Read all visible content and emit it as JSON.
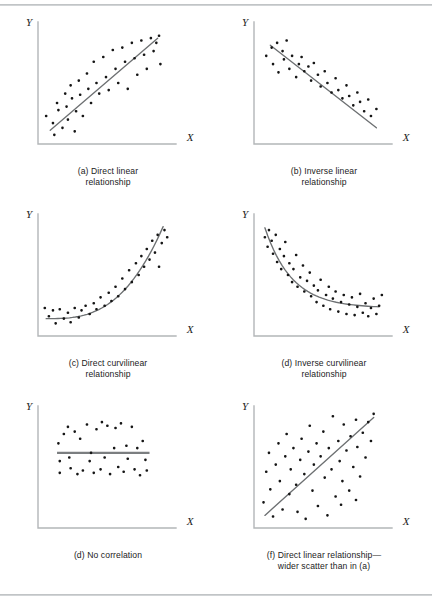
{
  "figure": {
    "background": "#ffffff",
    "rule_color": "#b9bcbe",
    "dot_color": "#151515",
    "axis_color": "#b3b6b8",
    "trend_color": "#6d7072",
    "axis_labels": {
      "x": "X",
      "y": "Y"
    }
  },
  "panels": [
    {
      "id": "a",
      "caption_line1": "(a) Direct linear",
      "caption_line2": "relationship"
    },
    {
      "id": "b",
      "caption_line1": "(b) Inverse linear",
      "caption_line2": "relationship"
    },
    {
      "id": "c",
      "caption_line1": "(c) Direct curvilinear",
      "caption_line2": "relationship"
    },
    {
      "id": "d",
      "caption_line1": "(d) Inverse curvilinear",
      "caption_line2": "relationship"
    },
    {
      "id": "e",
      "caption_line1": "(d) No correlation",
      "caption_line2": ""
    },
    {
      "id": "f",
      "caption_line1": "(f) Direct linear relationship—",
      "caption_line2": "wider scatter than in (a)"
    }
  ],
  "chart_data": [
    {
      "type": "scatter",
      "panel": "a",
      "title": "(a) Direct linear relationship",
      "xlabel": "X",
      "ylabel": "Y",
      "xlim": [
        0,
        100
      ],
      "ylim": [
        0,
        100
      ],
      "grid": false,
      "legend": "none",
      "trend": {
        "type": "line",
        "points": [
          [
            9,
            10
          ],
          [
            88,
            88
          ]
        ]
      },
      "points": [
        [
          6,
          22
        ],
        [
          11,
          16
        ],
        [
          12,
          6
        ],
        [
          14,
          33
        ],
        [
          15,
          27
        ],
        [
          18,
          12
        ],
        [
          20,
          41
        ],
        [
          21,
          30
        ],
        [
          22,
          19
        ],
        [
          24,
          48
        ],
        [
          25,
          37
        ],
        [
          27,
          9
        ],
        [
          28,
          26
        ],
        [
          30,
          52
        ],
        [
          31,
          40
        ],
        [
          33,
          22
        ],
        [
          36,
          58
        ],
        [
          37,
          45
        ],
        [
          39,
          33
        ],
        [
          41,
          68
        ],
        [
          43,
          50
        ],
        [
          45,
          41
        ],
        [
          48,
          72
        ],
        [
          50,
          55
        ],
        [
          52,
          44
        ],
        [
          55,
          78
        ],
        [
          57,
          62
        ],
        [
          59,
          50
        ],
        [
          62,
          80
        ],
        [
          64,
          68
        ],
        [
          66,
          45
        ],
        [
          69,
          84
        ],
        [
          71,
          71
        ],
        [
          73,
          57
        ],
        [
          76,
          86
        ],
        [
          78,
          74
        ],
        [
          80,
          62
        ],
        [
          83,
          88
        ],
        [
          85,
          77
        ],
        [
          87,
          84
        ],
        [
          89,
          90
        ],
        [
          90,
          66
        ]
      ]
    },
    {
      "type": "scatter",
      "panel": "b",
      "title": "(b) Inverse linear relationship",
      "xlabel": "X",
      "ylabel": "Y",
      "xlim": [
        0,
        100
      ],
      "ylim": [
        0,
        100
      ],
      "grid": false,
      "legend": "none",
      "trend": {
        "type": "line",
        "points": [
          [
            12,
            82
          ],
          [
            90,
            12
          ]
        ]
      },
      "points": [
        [
          9,
          73
        ],
        [
          13,
          80
        ],
        [
          14,
          66
        ],
        [
          17,
          84
        ],
        [
          18,
          59
        ],
        [
          21,
          77
        ],
        [
          22,
          70
        ],
        [
          24,
          86
        ],
        [
          26,
          62
        ],
        [
          28,
          73
        ],
        [
          31,
          55
        ],
        [
          33,
          66
        ],
        [
          35,
          72
        ],
        [
          37,
          60
        ],
        [
          40,
          64
        ],
        [
          42,
          52
        ],
        [
          44,
          67
        ],
        [
          47,
          57
        ],
        [
          49,
          47
        ],
        [
          52,
          60
        ],
        [
          54,
          50
        ],
        [
          57,
          42
        ],
        [
          60,
          54
        ],
        [
          62,
          44
        ],
        [
          65,
          37
        ],
        [
          68,
          48
        ],
        [
          70,
          39
        ],
        [
          73,
          31
        ],
        [
          76,
          42
        ],
        [
          78,
          34
        ],
        [
          81,
          26
        ],
        [
          84,
          36
        ],
        [
          86,
          22
        ],
        [
          90,
          28
        ]
      ]
    },
    {
      "type": "scatter",
      "panel": "c",
      "title": "(c) Direct curvilinear relationship",
      "xlabel": "X",
      "ylabel": "Y",
      "xlim": [
        0,
        100
      ],
      "ylim": [
        0,
        100
      ],
      "grid": false,
      "legend": "none",
      "trend": {
        "type": "curve",
        "shape": "exponential-rising"
      },
      "points": [
        [
          5,
          22
        ],
        [
          8,
          15
        ],
        [
          11,
          20
        ],
        [
          13,
          9
        ],
        [
          16,
          21
        ],
        [
          19,
          13
        ],
        [
          22,
          18
        ],
        [
          24,
          10
        ],
        [
          27,
          22
        ],
        [
          30,
          14
        ],
        [
          32,
          20
        ],
        [
          35,
          24
        ],
        [
          38,
          17
        ],
        [
          41,
          26
        ],
        [
          43,
          21
        ],
        [
          46,
          31
        ],
        [
          49,
          24
        ],
        [
          52,
          35
        ],
        [
          54,
          28
        ],
        [
          57,
          40
        ],
        [
          59,
          32
        ],
        [
          62,
          47
        ],
        [
          64,
          38
        ],
        [
          67,
          54
        ],
        [
          69,
          44
        ],
        [
          72,
          60
        ],
        [
          74,
          50
        ],
        [
          76,
          66
        ],
        [
          78,
          57
        ],
        [
          80,
          72
        ],
        [
          82,
          63
        ],
        [
          84,
          79
        ],
        [
          86,
          69
        ],
        [
          88,
          84
        ],
        [
          89,
          57
        ],
        [
          91,
          77
        ],
        [
          93,
          88
        ],
        [
          95,
          82
        ]
      ]
    },
    {
      "type": "scatter",
      "panel": "d",
      "title": "(d) Inverse curvilinear relationship",
      "xlabel": "X",
      "ylabel": "Y",
      "xlim": [
        0,
        100
      ],
      "ylim": [
        0,
        100
      ],
      "grid": false,
      "legend": "none",
      "trend": {
        "type": "curve",
        "shape": "exponential-decay"
      },
      "points": [
        [
          8,
          82
        ],
        [
          10,
          74
        ],
        [
          11,
          88
        ],
        [
          13,
          79
        ],
        [
          14,
          68
        ],
        [
          16,
          84
        ],
        [
          17,
          61
        ],
        [
          19,
          72
        ],
        [
          20,
          55
        ],
        [
          22,
          66
        ],
        [
          23,
          78
        ],
        [
          25,
          50
        ],
        [
          26,
          60
        ],
        [
          28,
          44
        ],
        [
          29,
          55
        ],
        [
          31,
          67
        ],
        [
          32,
          40
        ],
        [
          34,
          48
        ],
        [
          36,
          58
        ],
        [
          37,
          36
        ],
        [
          39,
          45
        ],
        [
          41,
          52
        ],
        [
          42,
          32
        ],
        [
          44,
          41
        ],
        [
          46,
          27
        ],
        [
          47,
          37
        ],
        [
          49,
          46
        ],
        [
          51,
          24
        ],
        [
          53,
          33
        ],
        [
          55,
          40
        ],
        [
          56,
          21
        ],
        [
          58,
          30
        ],
        [
          60,
          36
        ],
        [
          62,
          19
        ],
        [
          64,
          27
        ],
        [
          66,
          33
        ],
        [
          68,
          17
        ],
        [
          70,
          25
        ],
        [
          72,
          31
        ],
        [
          74,
          16
        ],
        [
          76,
          23
        ],
        [
          78,
          34
        ],
        [
          80,
          18
        ],
        [
          82,
          26
        ],
        [
          84,
          15
        ],
        [
          86,
          22
        ],
        [
          88,
          30
        ],
        [
          90,
          17
        ],
        [
          92,
          24
        ],
        [
          94,
          33
        ]
      ]
    },
    {
      "type": "scatter",
      "panel": "e",
      "title": "(d) No correlation",
      "xlabel": "X",
      "ylabel": "Y",
      "xlim": [
        0,
        100
      ],
      "ylim": [
        0,
        100
      ],
      "grid": false,
      "legend": "none",
      "trend": {
        "type": "line",
        "points": [
          [
            14,
            62
          ],
          [
            82,
            62
          ]
        ]
      },
      "points": [
        [
          15,
          70
        ],
        [
          16,
          55
        ],
        [
          16,
          45
        ],
        [
          19,
          78
        ],
        [
          22,
          84
        ],
        [
          23,
          58
        ],
        [
          24,
          49
        ],
        [
          27,
          80
        ],
        [
          29,
          44
        ],
        [
          31,
          74
        ],
        [
          33,
          47
        ],
        [
          36,
          86
        ],
        [
          38,
          55
        ],
        [
          39,
          62
        ],
        [
          41,
          45
        ],
        [
          43,
          82
        ],
        [
          46,
          48
        ],
        [
          47,
          88
        ],
        [
          49,
          58
        ],
        [
          51,
          85
        ],
        [
          53,
          44
        ],
        [
          56,
          66
        ],
        [
          57,
          83
        ],
        [
          59,
          50
        ],
        [
          61,
          87
        ],
        [
          63,
          46
        ],
        [
          65,
          68
        ],
        [
          66,
          57
        ],
        [
          69,
          84
        ],
        [
          71,
          48
        ],
        [
          73,
          66
        ],
        [
          75,
          43
        ],
        [
          77,
          72
        ],
        [
          79,
          56
        ],
        [
          80,
          47
        ]
      ]
    },
    {
      "type": "scatter",
      "panel": "f",
      "title": "(f) Direct linear relationship—wider scatter than in (a)",
      "xlabel": "X",
      "ylabel": "Y",
      "xlim": [
        0,
        100
      ],
      "ylim": [
        0,
        100
      ],
      "grid": false,
      "legend": "none",
      "trend": {
        "type": "line",
        "points": [
          [
            8,
            9
          ],
          [
            88,
            92
          ]
        ]
      },
      "points": [
        [
          7,
          20
        ],
        [
          9,
          46
        ],
        [
          11,
          62
        ],
        [
          12,
          31
        ],
        [
          14,
          8
        ],
        [
          16,
          52
        ],
        [
          18,
          70
        ],
        [
          19,
          38
        ],
        [
          21,
          14
        ],
        [
          23,
          59
        ],
        [
          24,
          78
        ],
        [
          26,
          27
        ],
        [
          27,
          48
        ],
        [
          29,
          66
        ],
        [
          31,
          35
        ],
        [
          32,
          12
        ],
        [
          34,
          56
        ],
        [
          35,
          74
        ],
        [
          37,
          44
        ],
        [
          38,
          6
        ],
        [
          40,
          63
        ],
        [
          41,
          85
        ],
        [
          43,
          30
        ],
        [
          44,
          52
        ],
        [
          46,
          70
        ],
        [
          47,
          17
        ],
        [
          49,
          59
        ],
        [
          51,
          80
        ],
        [
          52,
          41
        ],
        [
          54,
          9
        ],
        [
          55,
          66
        ],
        [
          57,
          48
        ],
        [
          58,
          93
        ],
        [
          60,
          25
        ],
        [
          62,
          72
        ],
        [
          63,
          55
        ],
        [
          65,
          38
        ],
        [
          66,
          86
        ],
        [
          68,
          64
        ],
        [
          70,
          30
        ],
        [
          71,
          76
        ],
        [
          73,
          50
        ],
        [
          75,
          90
        ],
        [
          76,
          67
        ],
        [
          78,
          42
        ],
        [
          80,
          79
        ],
        [
          82,
          58
        ],
        [
          84,
          88
        ],
        [
          86,
          72
        ],
        [
          88,
          95
        ],
        [
          75,
          22
        ],
        [
          64,
          18
        ]
      ]
    }
  ]
}
